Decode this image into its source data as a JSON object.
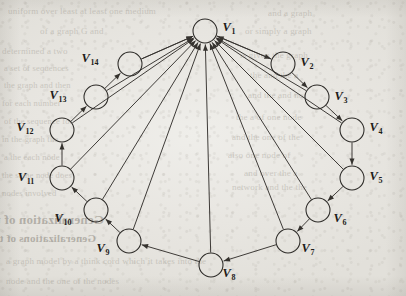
{
  "page": {
    "background_color": "#e9e7e2",
    "ink_color": "#2b2926",
    "type": "scanned-book-page-figure"
  },
  "figure": {
    "name": "directed-graph",
    "node_radius": 12,
    "nodes": [
      {
        "id": "V1",
        "label": "V",
        "sub": "1",
        "cx": 205,
        "cy": 31,
        "lx": 229,
        "ly": 31
      },
      {
        "id": "V2",
        "label": "V",
        "sub": "2",
        "cx": 283,
        "cy": 64,
        "lx": 307,
        "ly": 66
      },
      {
        "id": "V3",
        "label": "V",
        "sub": "3",
        "cx": 317,
        "cy": 97,
        "lx": 341,
        "ly": 100
      },
      {
        "id": "V4",
        "label": "V",
        "sub": "4",
        "cx": 352,
        "cy": 130,
        "lx": 376,
        "ly": 131
      },
      {
        "id": "V5",
        "label": "V",
        "sub": "5",
        "cx": 352,
        "cy": 178,
        "lx": 376,
        "ly": 180
      },
      {
        "id": "V6",
        "label": "V",
        "sub": "6",
        "cx": 318,
        "cy": 210,
        "lx": 340,
        "ly": 222
      },
      {
        "id": "V7",
        "label": "V",
        "sub": "7",
        "cx": 288,
        "cy": 241,
        "lx": 308,
        "ly": 252
      },
      {
        "id": "V8",
        "label": "V",
        "sub": "8",
        "cx": 211,
        "cy": 265,
        "lx": 229,
        "ly": 277
      },
      {
        "id": "V9",
        "label": "V",
        "sub": "9",
        "cx": 129,
        "cy": 241,
        "lx": 103,
        "ly": 252
      },
      {
        "id": "V10",
        "label": "V",
        "sub": "10",
        "cx": 96,
        "cy": 210,
        "lx": 63,
        "ly": 222
      },
      {
        "id": "V11",
        "label": "V",
        "sub": "11",
        "cx": 62,
        "cy": 178,
        "lx": 26,
        "ly": 181
      },
      {
        "id": "V12",
        "label": "V",
        "sub": "12",
        "cx": 62,
        "cy": 130,
        "lx": 25,
        "ly": 131
      },
      {
        "id": "V13",
        "label": "V",
        "sub": "13",
        "cx": 96,
        "cy": 97,
        "lx": 58,
        "ly": 99
      },
      {
        "id": "V14",
        "label": "V",
        "sub": "14",
        "cx": 130,
        "cy": 64,
        "lx": 90,
        "ly": 62
      }
    ],
    "edges_cycle_right": [
      {
        "from": "V1",
        "to": "V2"
      },
      {
        "from": "V2",
        "to": "V3"
      },
      {
        "from": "V3",
        "to": "V4"
      },
      {
        "from": "V4",
        "to": "V5"
      },
      {
        "from": "V5",
        "to": "V6"
      },
      {
        "from": "V6",
        "to": "V7"
      },
      {
        "from": "V7",
        "to": "V8"
      }
    ],
    "edges_cycle_left": [
      {
        "from": "V8",
        "to": "V9"
      },
      {
        "from": "V9",
        "to": "V10"
      },
      {
        "from": "V10",
        "to": "V11"
      },
      {
        "from": "V11",
        "to": "V12"
      },
      {
        "from": "V12",
        "to": "V13"
      },
      {
        "from": "V13",
        "to": "V14"
      },
      {
        "from": "V14",
        "to": "V1"
      }
    ],
    "edges_to_hub": [
      {
        "from": "V2",
        "to": "V1"
      },
      {
        "from": "V3",
        "to": "V1"
      },
      {
        "from": "V4",
        "to": "V1"
      },
      {
        "from": "V5",
        "to": "V1"
      },
      {
        "from": "V6",
        "to": "V1"
      },
      {
        "from": "V7",
        "to": "V1"
      },
      {
        "from": "V8",
        "to": "V1"
      },
      {
        "from": "V9",
        "to": "V1"
      },
      {
        "from": "V10",
        "to": "V1"
      },
      {
        "from": "V11",
        "to": "V1"
      },
      {
        "from": "V12",
        "to": "V1"
      },
      {
        "from": "V13",
        "to": "V1"
      },
      {
        "from": "V14",
        "to": "V1"
      }
    ]
  },
  "bleed_text": {
    "lines": [
      {
        "text": "uniform over least at least one medium",
        "x": 8,
        "y": 6,
        "size": 9,
        "mirror": false,
        "head": false
      },
      {
        "text": "of a graph G and",
        "x": 40,
        "y": 26,
        "size": 9,
        "mirror": false,
        "head": false
      },
      {
        "text": "determined a two",
        "x": 2,
        "y": 46,
        "size": 9,
        "mirror": false,
        "head": false
      },
      {
        "text": "a set of sequences",
        "x": 4,
        "y": 63,
        "size": 8.5,
        "mirror": false,
        "head": false
      },
      {
        "text": "the graph and then",
        "x": 4,
        "y": 80,
        "size": 8.5,
        "mirror": false,
        "head": false
      },
      {
        "text": "for each number",
        "x": 2,
        "y": 98,
        "size": 8.5,
        "mirror": false,
        "head": false
      },
      {
        "text": "of the sequence for",
        "x": 4,
        "y": 116,
        "size": 8.5,
        "mirror": false,
        "head": false
      },
      {
        "text": "in the graph the",
        "x": 2,
        "y": 134,
        "size": 8.5,
        "mirror": false,
        "head": false
      },
      {
        "text": "a the each node",
        "x": 4,
        "y": 152,
        "size": 8.5,
        "mirror": false,
        "head": false
      },
      {
        "text": "the same node does",
        "x": 2,
        "y": 170,
        "size": 8.5,
        "mirror": false,
        "head": false
      },
      {
        "text": "nodes involved",
        "x": 2,
        "y": 188,
        "size": 8.5,
        "mirror": false,
        "head": false
      },
      {
        "text": "and a graph",
        "x": 268,
        "y": 8,
        "size": 9,
        "mirror": false,
        "head": false
      },
      {
        "text": "or simply a graph",
        "x": 245,
        "y": 26,
        "size": 9,
        "mirror": false,
        "head": false
      },
      {
        "text": "is given the graph",
        "x": 240,
        "y": 50,
        "size": 9,
        "mirror": false,
        "head": false
      },
      {
        "text": "the and the a",
        "x": 250,
        "y": 70,
        "size": 9,
        "mirror": false,
        "head": false
      },
      {
        "text": "and the and not",
        "x": 248,
        "y": 90,
        "size": 9,
        "mirror": false,
        "head": false
      },
      {
        "text": "the a of one node",
        "x": 236,
        "y": 112,
        "size": 9,
        "mirror": false,
        "head": false
      },
      {
        "text": "and the one of the",
        "x": 232,
        "y": 132,
        "size": 9,
        "mirror": false,
        "head": false
      },
      {
        "text": "also one node of",
        "x": 228,
        "y": 150,
        "size": 9,
        "mirror": false,
        "head": false
      },
      {
        "text": "and over the a",
        "x": 244,
        "y": 168,
        "size": 9,
        "mirror": false,
        "head": false
      },
      {
        "text": "network and the the",
        "x": 232,
        "y": 182,
        "size": 9,
        "mirror": false,
        "head": false
      },
      {
        "text": "Generalization of the PNC Model",
        "x": 104,
        "y": 212,
        "size": 13,
        "mirror": true,
        "head": true
      },
      {
        "text": "Generalizations of the Assortative Group",
        "x": 96,
        "y": 232,
        "size": 11,
        "mirror": true,
        "head": true
      },
      {
        "text": "a graph model by a think cord which it takes into the",
        "x": 6,
        "y": 256,
        "size": 9,
        "mirror": false,
        "head": false
      },
      {
        "text": "node and the one of the nodes",
        "x": 6,
        "y": 276,
        "size": 9,
        "mirror": false,
        "head": false
      }
    ]
  }
}
